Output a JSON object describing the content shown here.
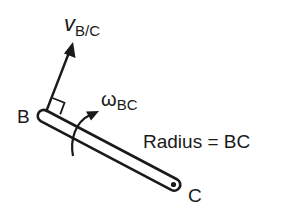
{
  "diagram": {
    "velocity_label": {
      "symbol": "v",
      "subscript": "B/C"
    },
    "point_b_label": "B",
    "point_c_label": "C",
    "angular_velocity_label": {
      "symbol": "ω",
      "subscript": "BC"
    },
    "radius_label": "Radius = BC",
    "colors": {
      "stroke": "#1a1a1a",
      "background": "#ffffff"
    }
  }
}
